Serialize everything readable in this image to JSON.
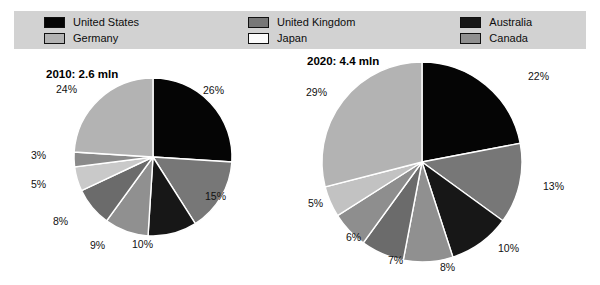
{
  "legend": {
    "columns": [
      [
        {
          "label": "United States",
          "color": "#050505",
          "key": "united-states"
        },
        {
          "label": "Germany",
          "color": "#b3b3b3",
          "key": "germany"
        }
      ],
      [
        {
          "label": "United Kingdom",
          "color": "#777777",
          "key": "united-kingdom"
        },
        {
          "label": "Japan",
          "color": "#fbfbfb",
          "key": "japan"
        }
      ],
      [
        {
          "label": "Australia",
          "color": "#171717",
          "key": "australia"
        },
        {
          "label": "Canada",
          "color": "#909090",
          "key": "canada"
        }
      ],
      [
        {
          "label": "France",
          "color": "#6b6b6b",
          "key": "france"
        },
        {
          "label": "Others",
          "color": "#a8a8a8",
          "key": "others"
        }
      ]
    ]
  },
  "charts": [
    {
      "id": "chart-2010",
      "title": "2010: 2.6 mln",
      "radius": 79,
      "labels": [
        {
          "text": "26%",
          "x": 181,
          "y": 28
        },
        {
          "text": "15%",
          "x": 183,
          "y": 134
        },
        {
          "text": "10%",
          "x": 110,
          "y": 182
        },
        {
          "text": "9%",
          "x": 68,
          "y": 183
        },
        {
          "text": "8%",
          "x": 31,
          "y": 159
        },
        {
          "text": "5%",
          "x": 9,
          "y": 122
        },
        {
          "text": "3%",
          "x": 9,
          "y": 93
        },
        {
          "text": "24%",
          "x": 34,
          "y": 27
        }
      ]
    },
    {
      "id": "chart-2020",
      "title": "2020: 4.4 mln",
      "radius": 100,
      "labels": [
        {
          "text": "22%",
          "x": 243,
          "y": 18
        },
        {
          "text": "13%",
          "x": 258,
          "y": 128
        },
        {
          "text": "10%",
          "x": 213,
          "y": 190
        },
        {
          "text": "8%",
          "x": 155,
          "y": 209
        },
        {
          "text": "7%",
          "x": 103,
          "y": 202
        },
        {
          "text": "6%",
          "x": 61,
          "y": 179
        },
        {
          "text": "5%",
          "x": 23,
          "y": 145
        },
        {
          "text": "29%",
          "x": 21,
          "y": 34
        }
      ]
    }
  ],
  "chart_data": [
    {
      "type": "pie",
      "title": "2010: 2.6 mln",
      "total": "2.6 mln",
      "year": 2010,
      "legend_position": "top",
      "categories": [
        "United States",
        "United Kingdom",
        "Australia",
        "Japan",
        "France",
        "Canada",
        "Others",
        "Germany"
      ],
      "values": [
        26,
        15,
        10,
        9,
        8,
        5,
        3,
        24
      ],
      "colors": [
        "#050505",
        "#777777",
        "#171717",
        "#909090",
        "#6b6b6b",
        "#c9c9c9",
        "#8a8a8a",
        "#b3b3b3"
      ],
      "labels": [
        "26%",
        "15%",
        "10%",
        "9%",
        "8%",
        "5%",
        "3%",
        "24%"
      ],
      "unit": "percent",
      "start_angle": 0,
      "direction": "clockwise"
    },
    {
      "type": "pie",
      "title": "2020: 4.4 mln",
      "total": "4.4 mln",
      "year": 2020,
      "legend_position": "top",
      "categories": [
        "United States",
        "United Kingdom",
        "Australia",
        "Japan",
        "France",
        "Canada",
        "Others",
        "Germany"
      ],
      "values": [
        22,
        13,
        10,
        8,
        7,
        6,
        5,
        29
      ],
      "colors": [
        "#050505",
        "#777777",
        "#171717",
        "#909090",
        "#6b6b6b",
        "#8e8e8e",
        "#c2c2c2",
        "#b3b3b3"
      ],
      "labels": [
        "22%",
        "13%",
        "10%",
        "8%",
        "7%",
        "6%",
        "5%",
        "29%"
      ],
      "unit": "percent",
      "start_angle": 0,
      "direction": "clockwise"
    }
  ]
}
